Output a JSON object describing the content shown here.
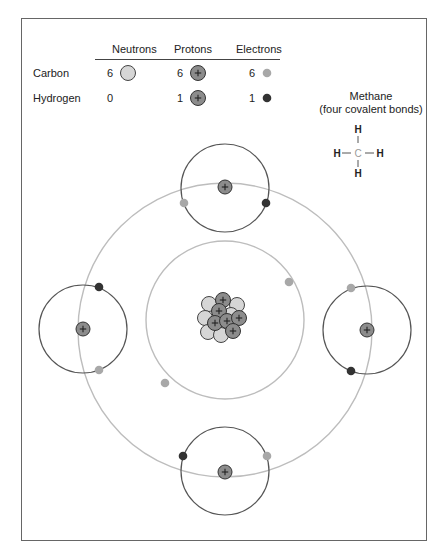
{
  "legend": {
    "headers": [
      "Neutrons",
      "Protons",
      "Electrons"
    ],
    "rows": [
      {
        "element": "Carbon",
        "neutrons": "6",
        "protons": "6",
        "electrons": "6"
      },
      {
        "element": "Hydrogen",
        "neutrons": "0",
        "protons": "1",
        "electrons": "1"
      }
    ]
  },
  "methane": {
    "title": "Methane",
    "subtitle": "(four covalent bonds)",
    "atoms": {
      "center": "C",
      "top": "H",
      "left": "H",
      "right": "H",
      "bottom": "H"
    }
  },
  "colors": {
    "neutron": "#d6d6d6",
    "proton": "#8c8c8c",
    "carbon_electron": "#a8a8a8",
    "hydrogen_electron": "#333333",
    "carbon_orbit": "#bdbdbd",
    "hydrogen_orbit": "#555555",
    "frame": "#666666",
    "carbon_symbol": "#9a9a9a"
  },
  "diagram": {
    "carbon_nucleus": {
      "protons": 6,
      "neutrons": 6
    },
    "carbon_inner_shell_electrons": 2,
    "carbon_outer_shell_electrons": 4,
    "hydrogen_atoms": 4,
    "proton_symbol": "+"
  }
}
